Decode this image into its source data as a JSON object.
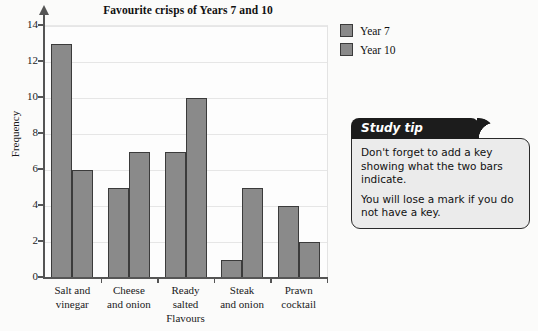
{
  "chart_data": {
    "type": "bar",
    "title": "Favourite crisps of Years 7 and 10",
    "xlabel": "Flavours",
    "ylabel": "Frequency",
    "categories": [
      "Salt and vinegar",
      "Cheese and onion",
      "Ready salted",
      "Steak and onion",
      "Prawn cocktail"
    ],
    "category_lines": [
      [
        "Salt and",
        "vinegar"
      ],
      [
        "Cheese",
        "and onion"
      ],
      [
        "Ready",
        "salted"
      ],
      [
        "Steak",
        "and onion"
      ],
      [
        "Prawn",
        "cocktail"
      ]
    ],
    "series": [
      {
        "name": "Year 7",
        "values": [
          13,
          5,
          7,
          1,
          4
        ]
      },
      {
        "name": "Year 10",
        "values": [
          6,
          7,
          10,
          5,
          2
        ]
      }
    ],
    "ylim": [
      0,
      14
    ],
    "ytick_values": [
      0,
      2,
      4,
      6,
      8,
      10,
      12,
      14
    ],
    "ytick_labels": [
      "0",
      "2",
      "4",
      "6",
      "8",
      "10",
      "12",
      "14"
    ],
    "grid": true,
    "legend_position": "right",
    "bar_color": "#8a8a8a",
    "bar_edge_color": "#3b3b3b"
  },
  "legend": {
    "items": [
      {
        "label": "Year 7"
      },
      {
        "label": "Year 10"
      }
    ]
  },
  "study_tip": {
    "title": "Study tip",
    "paragraphs": [
      "Don't forget to add a key showing what the two bars indicate.",
      "You will lose a mark if you do not have a key."
    ]
  }
}
